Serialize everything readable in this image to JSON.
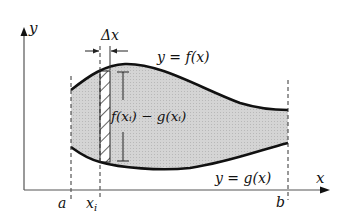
{
  "diagram": {
    "axes": {
      "x_label": "x",
      "y_label": "y"
    },
    "curves": {
      "top_label": "y = f(x)",
      "bottom_label": "y = g(x)"
    },
    "rectangle": {
      "width_label": "Δx",
      "height_label": "f(xᵢ) − g(xᵢ)"
    },
    "ticks": {
      "a": "a",
      "xi": "x",
      "xi_sub": "i",
      "b": "b"
    },
    "colors": {
      "region_fill": "#cfcfcf",
      "curve": "#111111",
      "axis": "#444444"
    }
  }
}
